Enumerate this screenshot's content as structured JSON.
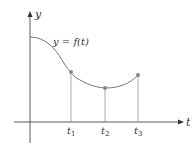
{
  "diagram": {
    "y_axis_label": "y",
    "x_axis_label": "t",
    "curve_label": "y = f(t)",
    "ticks": [
      {
        "name": "t",
        "sub": "1"
      },
      {
        "name": "t",
        "sub": "2"
      },
      {
        "name": "t",
        "sub": "3"
      }
    ],
    "colors": {
      "axis": "#333333",
      "curve": "#777777",
      "points": "#888888",
      "drop_lines": "#888888"
    }
  }
}
